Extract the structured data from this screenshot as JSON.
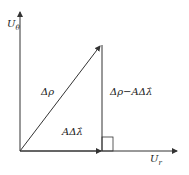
{
  "diagram": {
    "y_axis_label": "U",
    "y_axis_sub": "θ",
    "x_axis_label": "U",
    "x_axis_sub": "r",
    "hypotenuse_label": "Δρ",
    "vertical_label": "Δρ−AΔλ̂",
    "base_label": "AΔλ̂",
    "colors": {
      "line": "#333333",
      "background": "#ffffff"
    }
  }
}
